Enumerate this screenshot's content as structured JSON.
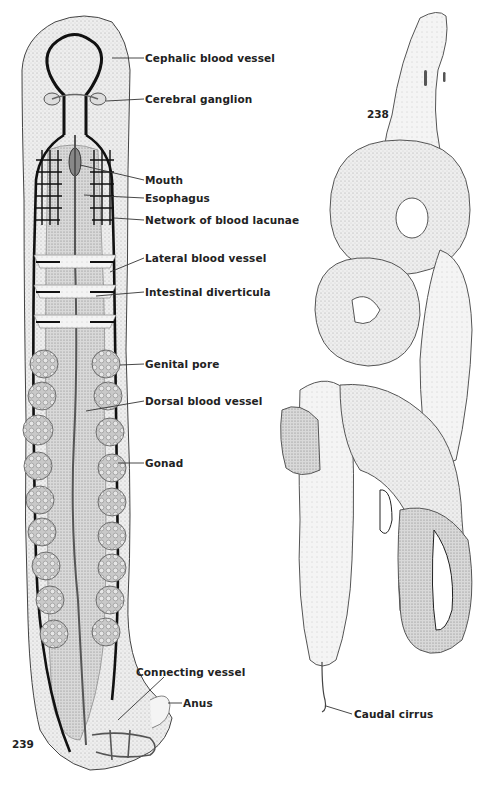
{
  "figures": [
    {
      "number": "239",
      "subject": "flatworm-like ribbon worm, internal anatomy (dorsal view)",
      "labels": [
        {
          "text": "Cephalic blood vessel"
        },
        {
          "text": "Cerebral ganglion"
        },
        {
          "text": "Mouth"
        },
        {
          "text": "Esophagus"
        },
        {
          "text": "Network of blood lacunae"
        },
        {
          "text": "Lateral blood vessel"
        },
        {
          "text": "Intestinal diverticula"
        },
        {
          "text": "Genital pore"
        },
        {
          "text": "Dorsal blood vessel"
        },
        {
          "text": "Gonad"
        },
        {
          "text": "Connecting vessel"
        },
        {
          "text": "Anus"
        }
      ]
    },
    {
      "number": "238",
      "subject": "coiled ribbon worm, external view",
      "labels": [
        {
          "text": "Caudal cirrus"
        }
      ]
    }
  ],
  "colors": {
    "background": "#ffffff",
    "ink": "#1a1a1a",
    "body_fill": "#ececec",
    "gut_fill": "#d6d6d6",
    "gonad_fill": "#bdbdbd",
    "vessel": "#111111"
  }
}
